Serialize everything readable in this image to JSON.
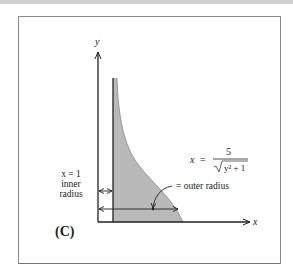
{
  "figure": {
    "panel_label": "(C)",
    "axes": {
      "x_label": "x",
      "y_label": "y"
    },
    "equation": {
      "lhs": "x",
      "equals": "=",
      "numerator": "5",
      "denominator": "y² + 1",
      "sqrt": "√"
    },
    "annotations": {
      "outer": "= outer radius",
      "inner_line1": "x = 1",
      "inner_line2": "inner",
      "inner_line3": "radius"
    },
    "colors": {
      "shade": "#b9b9b9",
      "line": "#222222",
      "frame": "#8a8a8a"
    }
  }
}
